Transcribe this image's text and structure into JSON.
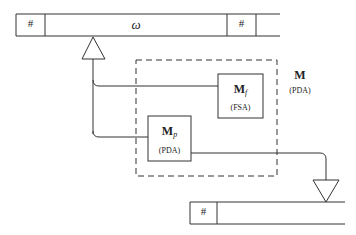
{
  "input_tape": {
    "left_marker": "#",
    "content": "ω",
    "right_marker": "#"
  },
  "output_tape": {
    "left_marker": "#"
  },
  "machine": {
    "name": "M",
    "type": "(PDA)"
  },
  "component_f": {
    "name": "M",
    "subscript": "f",
    "type": "(FSA)"
  },
  "component_p": {
    "name": "M",
    "subscript": "p",
    "type": "(PDA)"
  },
  "colors": {
    "line": "#333333",
    "background": "#ffffff"
  }
}
